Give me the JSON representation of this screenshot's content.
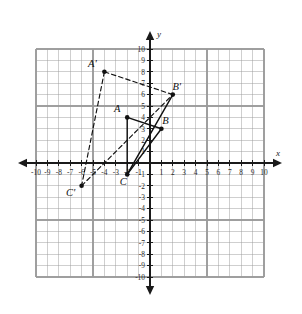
{
  "figure": {
    "background_color": "#ffffff",
    "grid_color": "#9a9a9a",
    "axis_color": "#1a1a1a",
    "shape_color": "#111111"
  },
  "axes": {
    "x_label": "x",
    "y_label": "y",
    "x_min": -10,
    "x_max": 10,
    "y_min": -10,
    "y_max": 10,
    "step": 1,
    "grid": true,
    "x_tick_labels": [
      "-10",
      "-9",
      "-8",
      "-7",
      "-6",
      "-5",
      "-4",
      "-3",
      "-2",
      "-1",
      "1",
      "2",
      "3",
      "4",
      "5",
      "6",
      "7",
      "8",
      "9",
      "10"
    ],
    "y_tick_labels": [
      "10",
      "9",
      "8",
      "7",
      "6",
      "5",
      "4",
      "3",
      "2",
      "1",
      "-1",
      "-2",
      "-3",
      "-4",
      "-5",
      "-6",
      "-7",
      "-8",
      "-9",
      "-10"
    ]
  },
  "chart_data": {
    "type": "scatter",
    "xlabel": "x",
    "ylabel": "y",
    "xlim": [
      -10,
      10
    ],
    "ylim": [
      -10,
      10
    ],
    "grid": true,
    "legend": "none",
    "points": [
      {
        "label": "A",
        "x": -2,
        "y": 4,
        "label_dx": -10,
        "label_dy": -5,
        "style": "solid"
      },
      {
        "label": "B",
        "x": 1,
        "y": 3,
        "label_dx": 4,
        "label_dy": -5,
        "style": "solid"
      },
      {
        "label": "C",
        "x": -2,
        "y": -1,
        "label_dx": -4,
        "label_dy": 11,
        "style": "solid"
      },
      {
        "label": "A'",
        "x": -4,
        "y": 8,
        "label_dx": -12,
        "label_dy": -5,
        "style": "dashed"
      },
      {
        "label": "B'",
        "x": 2,
        "y": 6,
        "label_dx": 4,
        "label_dy": -5,
        "style": "dashed"
      },
      {
        "label": "C'",
        "x": -6,
        "y": -2,
        "label_dx": -11,
        "label_dy": 10,
        "style": "dashed"
      }
    ],
    "segments": [
      {
        "name": "A-B",
        "from": [
          -2,
          4
        ],
        "to": [
          1,
          3
        ],
        "style": "solid"
      },
      {
        "name": "A-C",
        "from": [
          -2,
          4
        ],
        "to": [
          -2,
          -1
        ],
        "style": "solid"
      },
      {
        "name": "C-B",
        "from": [
          -2,
          -1
        ],
        "to": [
          1,
          3
        ],
        "style": "solid"
      },
      {
        "name": "C-B-prime",
        "from": [
          -2,
          -1
        ],
        "to": [
          2,
          6
        ],
        "style": "solid"
      },
      {
        "name": "A-prime-B-prime",
        "from": [
          -4,
          8
        ],
        "to": [
          2,
          6
        ],
        "style": "dashed"
      },
      {
        "name": "A-prime-C-prime",
        "from": [
          -4,
          8
        ],
        "to": [
          -6,
          -2
        ],
        "style": "dashed"
      },
      {
        "name": "C-prime-B-prime",
        "from": [
          -6,
          -2
        ],
        "to": [
          2,
          6
        ],
        "style": "dashed"
      }
    ]
  }
}
